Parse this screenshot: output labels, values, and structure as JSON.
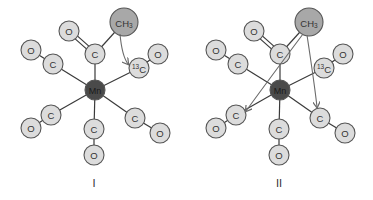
{
  "colors": {
    "metal_fill": "#4a4a4a",
    "methyl_fill": "#a8a8a8",
    "ligand_fill": "#dcdcdc",
    "bond": "#3a3a3a",
    "arrow": "#6a6a6a"
  },
  "structures": [
    {
      "label": "I",
      "metal": "Mn",
      "methyl": {
        "main": "CH",
        "sub": "3"
      },
      "acyl_carbon": "C",
      "acyl_oxygen": "O",
      "ligands": [
        {
          "carbon": "C",
          "oxygen": "O"
        },
        {
          "carbon": "C",
          "carbon_isotope": "13",
          "oxygen": "O"
        },
        {
          "carbon": "C",
          "oxygen": "O"
        },
        {
          "carbon": "C",
          "oxygen": "O"
        },
        {
          "carbon": "C",
          "oxygen": "O"
        }
      ],
      "migration_arrows": [
        "to-13CO"
      ]
    },
    {
      "label": "II",
      "metal": "Mn",
      "methyl": {
        "main": "CH",
        "sub": "3"
      },
      "acyl_carbon": "C",
      "acyl_oxygen": "O",
      "ligands": [
        {
          "carbon": "C",
          "oxygen": "O"
        },
        {
          "carbon": "C",
          "carbon_isotope": "13",
          "oxygen": "O"
        },
        {
          "carbon": "C",
          "oxygen": "O"
        },
        {
          "carbon": "C",
          "oxygen": "O"
        },
        {
          "carbon": "C",
          "oxygen": "O"
        }
      ],
      "migration_arrows": [
        "to-lower-left-CO",
        "to-lower-right-CO"
      ]
    }
  ]
}
